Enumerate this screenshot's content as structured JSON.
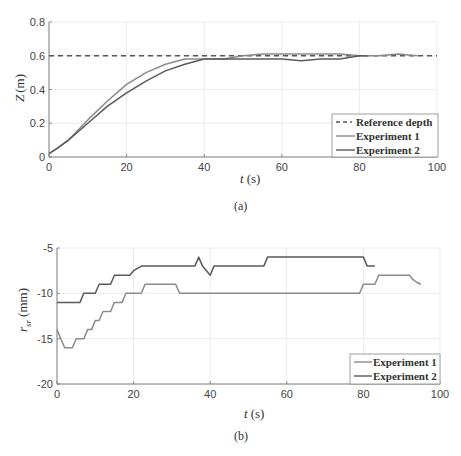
{
  "chart_data": [
    {
      "type": "line",
      "title": "",
      "caption": "(a)",
      "xlabel": "t (s)",
      "ylabel": "Z (m)",
      "xlim": [
        0,
        100
      ],
      "ylim": [
        0,
        0.8
      ],
      "xticks": [
        0,
        20,
        40,
        60,
        80,
        100
      ],
      "yticks": [
        0,
        0.2,
        0.4,
        0.6,
        0.8
      ],
      "grid": true,
      "legend_position": "lower right",
      "series": [
        {
          "name": "Reference depth",
          "style": "dashed",
          "color": "#555555",
          "x": [
            0,
            100
          ],
          "y": [
            0.6,
            0.6
          ]
        },
        {
          "name": "Experiment 1",
          "style": "solid",
          "color": "#8a8a8a",
          "x": [
            0,
            2,
            5,
            10,
            15,
            20,
            25,
            30,
            35,
            40,
            45,
            50,
            55,
            60,
            65,
            70,
            75,
            80,
            85,
            90,
            95
          ],
          "y": [
            0.02,
            0.05,
            0.1,
            0.22,
            0.33,
            0.43,
            0.5,
            0.55,
            0.58,
            0.58,
            0.58,
            0.6,
            0.61,
            0.61,
            0.61,
            0.61,
            0.61,
            0.6,
            0.6,
            0.61,
            0.6
          ]
        },
        {
          "name": "Experiment 2",
          "style": "solid",
          "color": "#5a5a5a",
          "x": [
            0,
            2,
            5,
            10,
            15,
            20,
            25,
            30,
            35,
            40,
            45,
            50,
            55,
            60,
            65,
            70,
            75,
            80,
            82
          ],
          "y": [
            0.02,
            0.05,
            0.1,
            0.2,
            0.3,
            0.38,
            0.45,
            0.51,
            0.55,
            0.58,
            0.58,
            0.58,
            0.58,
            0.58,
            0.57,
            0.58,
            0.58,
            0.6,
            0.6
          ]
        }
      ]
    },
    {
      "type": "line",
      "title": "",
      "caption": "(b)",
      "xlabel": "t (s)",
      "ylabel": "r_sr (mm)",
      "xlim": [
        0,
        100
      ],
      "ylim": [
        -20,
        -5
      ],
      "xticks": [
        0,
        20,
        40,
        60,
        80,
        100
      ],
      "yticks": [
        -20,
        -15,
        -10,
        -5
      ],
      "grid": true,
      "legend_position": "lower right",
      "series": [
        {
          "name": "Experiment 1",
          "style": "solid",
          "color": "#8a8a8a",
          "x": [
            0,
            1,
            2,
            4,
            5,
            7,
            8,
            9,
            10,
            11,
            12,
            13,
            14,
            15,
            16,
            17,
            18,
            19,
            20,
            22,
            23,
            24,
            31,
            32,
            79,
            80,
            83,
            84,
            86,
            92,
            93,
            94,
            95
          ],
          "y": [
            -14,
            -15,
            -16,
            -16,
            -15,
            -15,
            -14,
            -14,
            -13,
            -13,
            -12,
            -12,
            -12,
            -11,
            -11,
            -11,
            -10,
            -10,
            -10,
            -10,
            -9,
            -9,
            -9,
            -10,
            -10,
            -9,
            -9,
            -8,
            -8,
            -8,
            -8.5,
            -8.8,
            -9
          ]
        },
        {
          "name": "Experiment 2",
          "style": "solid",
          "color": "#5a5a5a",
          "x": [
            0,
            6,
            7,
            10,
            11,
            14,
            15,
            19,
            20,
            22,
            36,
            37,
            38,
            40,
            41,
            54,
            55,
            80,
            81,
            83
          ],
          "y": [
            -11,
            -11,
            -10,
            -10,
            -9,
            -9,
            -8,
            -8,
            -7.5,
            -7,
            -7,
            -6,
            -7,
            -8,
            -7,
            -7,
            -6,
            -6,
            -7,
            -7
          ]
        }
      ]
    }
  ],
  "charts": {
    "a": {
      "ylabel_main": "Z",
      "ylabel_unit": "(m)",
      "xlabel_main": "t",
      "xlabel_unit": "(s)",
      "caption": "(a)",
      "legend": [
        "Reference depth",
        "Experiment 1",
        "Experiment 2"
      ]
    },
    "b": {
      "ylabel_main": "r",
      "ylabel_sub": "sr",
      "ylabel_unit": "(mm)",
      "xlabel_main": "t",
      "xlabel_unit": "(s)",
      "caption": "(b)",
      "legend": [
        "Experiment 1",
        "Experiment 2"
      ]
    }
  }
}
